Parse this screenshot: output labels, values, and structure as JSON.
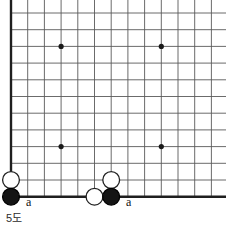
{
  "figure": {
    "caption": "5도",
    "caption_pos": {
      "x": 6,
      "y": 213
    },
    "width": 226,
    "height": 228
  },
  "board": {
    "type": "go-board-corner",
    "origin_x": 11,
    "origin_y": 13,
    "spacing": 16.7,
    "cols": 13,
    "rows": 12,
    "line_color": "#5a5a5a",
    "edge_color": "#1f1f1f",
    "edge_width": 2.4,
    "line_width": 0.9,
    "background": "#ffffff",
    "left_edge_is_board_border": true,
    "bottom_edge_is_board_border": true,
    "top_open": true,
    "right_open": true,
    "star_points": [
      {
        "col": 3,
        "row": 2
      },
      {
        "col": 9,
        "row": 2
      },
      {
        "col": 3,
        "row": 8
      },
      {
        "col": 9,
        "row": 8
      }
    ],
    "star_radius": 2.6,
    "star_color": "#1a1a1a"
  },
  "stones": [
    {
      "id": "w1",
      "color": "white",
      "col": 0,
      "row": 10,
      "radius": 8.4
    },
    {
      "id": "b1",
      "color": "black",
      "col": 0,
      "row": 11,
      "radius": 8.4
    },
    {
      "id": "w2",
      "color": "white",
      "col": 6,
      "row": 10,
      "radius": 8.4
    },
    {
      "id": "w3",
      "color": "white",
      "col": 5,
      "row": 11,
      "radius": 8.4
    },
    {
      "id": "b2",
      "color": "black",
      "col": 6,
      "row": 11,
      "radius": 8.4
    }
  ],
  "stone_style": {
    "black_fill": "#141414",
    "black_stroke": "#000000",
    "white_fill": "#ffffff",
    "white_stroke": "#222222",
    "stroke_width": 1.3
  },
  "point_labels": [
    {
      "id": "label-a-left",
      "text": "a",
      "x": 26,
      "y": 196
    },
    {
      "id": "label-a-right",
      "text": "a",
      "x": 126,
      "y": 196
    }
  ]
}
